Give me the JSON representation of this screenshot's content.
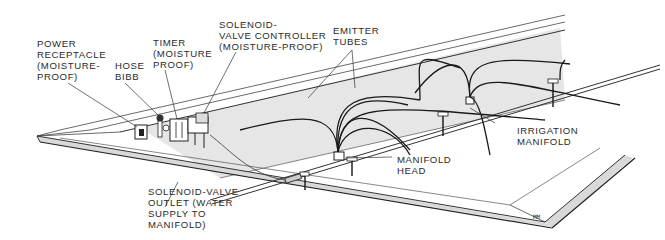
{
  "diagram": {
    "labels": {
      "power_receptacle": "POWER\nRECEPTACLE\n(MOISTURE-\nPROOF)",
      "hose_bibb": "HOSE\nBIBB",
      "timer": "TIMER\n(MOISTURE\nPROOF)",
      "solenoid_controller": "SOLENOID-\nVALVE CONTROLLER\n(MOISTURE-PROOF)",
      "emitter_tubes": "EMITTER\nTUBES",
      "manifold_head": "MANIFOLD\nHEAD",
      "irrigation_manifold": "IRRIGATION\nMANIFOLD",
      "solenoid_outlet": "SOLENOID-VALVE\nOUTLET (WATER\nSUPPLY TO\nMANIFOLD)"
    },
    "signature": "MM",
    "colors": {
      "line": "#2b2b2b",
      "wall_shade": "#e6e6e6",
      "rim_shade": "#d9d9d9",
      "background": "#ffffff"
    }
  }
}
